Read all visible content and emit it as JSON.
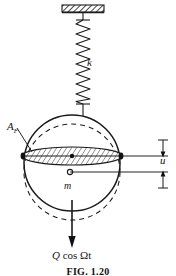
{
  "figure": {
    "caption": "FIG. 1.20",
    "labels": {
      "spring_stiffness": "k",
      "area": "A",
      "area_subscript": "F",
      "displacement": "u",
      "mass": "m",
      "force_symbol": "Q",
      "force_function": " cos Ωt"
    },
    "colors": {
      "ink": "#161616",
      "line": "#1a1a1a",
      "hatch": "#333333",
      "background": "#ffffff"
    },
    "elements": {
      "ceiling_support": "hatched-fixed-support",
      "spring": "coil-spring-zigzag",
      "body": "sphere-circle-outline",
      "displaced_body": "dashed-circle-outline",
      "disc": "hatched-ellipse-cross-section",
      "center_marker": "solid-dot",
      "mass_marker": "open-circle",
      "force_arrow": "downward-arrow",
      "dimension_arrow": "vertical-double-arrow"
    },
    "geometry": {
      "sphere_center_x": 72,
      "sphere_center_y": 163,
      "sphere_radius": 48,
      "dashed_center_y": 172,
      "disc_center_y": 156,
      "disc_rx": 50,
      "disc_ry": 9
    }
  }
}
